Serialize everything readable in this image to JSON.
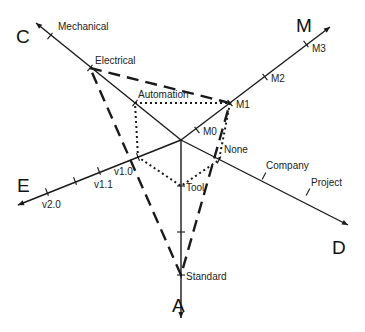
{
  "diagram": {
    "type": "radar-maturity-diagram",
    "center": [
      181,
      140
    ],
    "axes": [
      {
        "id": "A",
        "label": "A",
        "tip": [
          181,
          318
        ],
        "label_pos": [
          172,
          312
        ],
        "ticks": [
          {
            "label": "Tool",
            "pos": [
              181,
              186
            ],
            "label_pos": [
              186,
              191
            ]
          },
          {
            "label": "",
            "pos": [
              181,
              232
            ],
            "label_pos": [
              186,
              237
            ]
          },
          {
            "label": "Standard",
            "pos": [
              181,
              275
            ],
            "label_pos": [
              186,
              280
            ]
          }
        ]
      },
      {
        "id": "C",
        "label": "C",
        "tip": [
          36,
          23
        ],
        "label_pos": [
          16,
          43
        ],
        "ticks": [
          {
            "label": "Mechanical",
            "pos": [
              50,
              36
            ],
            "label_pos": [
              58,
              30
            ]
          },
          {
            "label": "Electrical",
            "pos": [
              90,
              68
            ],
            "label_pos": [
              95,
              64
            ]
          },
          {
            "label": "Automation",
            "pos": [
              135,
              103
            ],
            "label_pos": [
              138,
              98
            ]
          }
        ]
      },
      {
        "id": "M",
        "label": "M",
        "tip": [
          330,
          27
        ],
        "label_pos": [
          296,
          32
        ],
        "ticks": [
          {
            "label": "M0",
            "pos": [
              197,
              130
            ],
            "label_pos": [
              203,
              135
            ]
          },
          {
            "label": "M1",
            "pos": [
              230,
              103
            ],
            "label_pos": [
              236,
              108
            ]
          },
          {
            "label": "M2",
            "pos": [
              265,
              77
            ],
            "label_pos": [
              271,
              82
            ]
          },
          {
            "label": "M3",
            "pos": [
              306,
              44
            ],
            "label_pos": [
              312,
              52
            ]
          }
        ]
      },
      {
        "id": "D",
        "label": "D",
        "tip": [
          348,
          225
        ],
        "label_pos": [
          332,
          254
        ],
        "ticks": [
          {
            "label": "None",
            "pos": [
              219,
              160
            ],
            "label_pos": [
              224,
              153
            ]
          },
          {
            "label": "Company",
            "pos": [
              264,
              176
            ],
            "label_pos": [
              266,
              169
            ]
          },
          {
            "label": "Project",
            "pos": [
              308,
              192
            ],
            "label_pos": [
              311,
              186
            ]
          }
        ]
      },
      {
        "id": "E",
        "label": "E",
        "tip": [
          18,
          205
        ],
        "label_pos": [
          17,
          192
        ],
        "ticks": [
          {
            "label": "v2.0",
            "pos": [
              47,
              192
            ],
            "label_pos": [
              42,
              208
            ]
          },
          {
            "label": "",
            "pos": [
              75,
              181
            ],
            "label_pos": [
              70,
              198
            ]
          },
          {
            "label": "v1.1",
            "pos": [
              99,
              171
            ],
            "label_pos": [
              94,
              188
            ]
          },
          {
            "label": "v1.0",
            "pos": [
              138,
              157
            ],
            "label_pos": [
              114,
              175
            ]
          }
        ]
      }
    ],
    "profiles": [
      {
        "name": "dashed-profile",
        "style": "dashed",
        "points": [
          "Electrical",
          "M1",
          "Standard"
        ],
        "coords": [
          [
            90,
            68
          ],
          [
            230,
            103
          ],
          [
            181,
            275
          ]
        ]
      },
      {
        "name": "dotted-profile",
        "style": "dotted",
        "points": [
          "Automation",
          "M1",
          "None",
          "Tool",
          "v1.0"
        ],
        "coords": [
          [
            135,
            103
          ],
          [
            230,
            103
          ],
          [
            219,
            160
          ],
          [
            181,
            186
          ],
          [
            138,
            157
          ]
        ]
      }
    ],
    "colors": {
      "line": "#1a1a1a",
      "text": "#222222",
      "background": "#ffffff"
    }
  }
}
